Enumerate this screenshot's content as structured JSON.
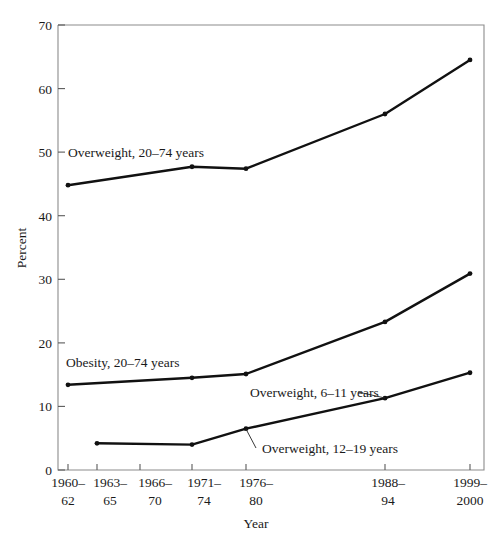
{
  "chart_data": {
    "type": "line",
    "title": "",
    "xlabel": "Year",
    "ylabel": "Percent",
    "ylim": [
      0,
      70
    ],
    "yticks": [
      0,
      10,
      20,
      30,
      40,
      50,
      60,
      70
    ],
    "grid": false,
    "legend_position": "inline-annotations",
    "categories": [
      "1960–62",
      "1963–65",
      "1966–70",
      "1971–74",
      "1976–80",
      "1988–94",
      "1999–2000"
    ],
    "category_lines": [
      [
        "1960–",
        "62"
      ],
      [
        "1963–",
        "65"
      ],
      [
        "1966–",
        "70"
      ],
      [
        "1971–",
        "74"
      ],
      [
        "1976–",
        "80"
      ],
      [
        "1988–",
        "94"
      ],
      [
        "1999–",
        "2000"
      ]
    ],
    "x_positions_px": [
      68,
      97,
      140,
      192,
      246,
      385,
      470
    ],
    "series": [
      {
        "name": "Overweight, 20–74 years",
        "values": [
          44.8,
          null,
          null,
          47.7,
          47.4,
          56.0,
          64.5
        ],
        "annotation": "Overweight, 20–74 years",
        "color": "#111111"
      },
      {
        "name": "Obesity, 20–74 years",
        "values": [
          13.4,
          null,
          null,
          14.5,
          15.1,
          23.3,
          30.9
        ],
        "annotation": "Obesity, 20–74 years",
        "color": "#111111"
      },
      {
        "name": "Overweight, 6–11 years",
        "values": [
          null,
          4.2,
          null,
          4.0,
          6.5,
          11.3,
          15.3
        ],
        "annotation": "Overweight, 6–11 years",
        "color": "#111111"
      },
      {
        "name": "Overweight, 12–19 years",
        "values": [
          null,
          4.2,
          null,
          4.0,
          6.5,
          11.3,
          15.3
        ],
        "annotation": "Overweight, 12–19 years",
        "color": "#111111"
      }
    ]
  },
  "axes": {
    "y_title": "Percent",
    "x_title": "Year",
    "y_tick_labels": [
      "0",
      "10",
      "20",
      "30",
      "40",
      "50",
      "60",
      "70"
    ],
    "x_tick_labels_top": [
      "1960–",
      "1963–",
      "1966–",
      "1971–",
      "1976–",
      "1988–",
      "1999–"
    ],
    "x_tick_labels_bottom": [
      "62",
      "65",
      "70",
      "74",
      "80",
      "94",
      "2000"
    ]
  },
  "annotations": {
    "overweight_adults": "Overweight, 20–74 years",
    "obesity_adults": "Obesity, 20–74 years",
    "overweight_6_11": "Overweight, 6–11 years",
    "overweight_12_19": "Overweight, 12–19 years"
  },
  "colors": {
    "line": "#111111",
    "frame": "#8c8c8c",
    "text": "#1a1a1a",
    "background": "#ffffff"
  }
}
